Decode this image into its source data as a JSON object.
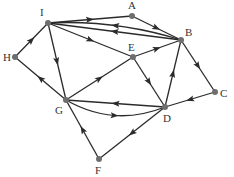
{
  "diagram": {
    "type": "directed-graph",
    "colors": {
      "edge": "#2b2b2b",
      "node": "#6e6e6e",
      "label": "#333333"
    },
    "nodes": [
      {
        "id": "I",
        "label": "I",
        "x": 48,
        "y": 23,
        "lx": 40,
        "ly": 16
      },
      {
        "id": "A",
        "label": "A",
        "x": 132,
        "y": 16,
        "lx": 128,
        "ly": 9
      },
      {
        "id": "B",
        "label": "B",
        "x": 181,
        "y": 40,
        "lx": 185,
        "ly": 36
      },
      {
        "id": "E",
        "label": "E",
        "x": 133,
        "y": 57,
        "lx": 128,
        "ly": 51
      },
      {
        "id": "H",
        "label": "H",
        "x": 15,
        "y": 57,
        "lx": 3,
        "ly": 61
      },
      {
        "id": "C",
        "label": "C",
        "x": 215,
        "y": 92,
        "lx": 220,
        "ly": 97
      },
      {
        "id": "G",
        "label": "G",
        "x": 66,
        "y": 100,
        "lx": 55,
        "ly": 114
      },
      {
        "id": "D",
        "label": "D",
        "x": 165,
        "y": 107,
        "lx": 163,
        "ly": 122
      },
      {
        "id": "F",
        "label": "F",
        "x": 99,
        "y": 159,
        "lx": 95,
        "ly": 174
      }
    ],
    "edges": [
      {
        "from": "I",
        "to": "A",
        "curve": 0
      },
      {
        "from": "A",
        "to": "B",
        "curve": 0
      },
      {
        "from": "B",
        "to": "I",
        "curve": 0
      },
      {
        "from": "B",
        "to": "I",
        "curve": 6
      },
      {
        "from": "I",
        "to": "E",
        "curve": 0
      },
      {
        "from": "H",
        "to": "I",
        "curve": 0
      },
      {
        "from": "I",
        "to": "G",
        "curve": 0
      },
      {
        "from": "G",
        "to": "H",
        "curve": 0
      },
      {
        "from": "G",
        "to": "E",
        "curve": 0
      },
      {
        "from": "E",
        "to": "B",
        "curve": 0
      },
      {
        "from": "E",
        "to": "D",
        "curve": 0
      },
      {
        "from": "B",
        "to": "C",
        "curve": 0
      },
      {
        "from": "C",
        "to": "D",
        "curve": 0
      },
      {
        "from": "D",
        "to": "B",
        "curve": 0
      },
      {
        "from": "D",
        "to": "G",
        "curve": 0
      },
      {
        "from": "G",
        "to": "D",
        "curve": 12
      },
      {
        "from": "D",
        "to": "F",
        "curve": 0
      },
      {
        "from": "F",
        "to": "G",
        "curve": 0
      }
    ]
  }
}
